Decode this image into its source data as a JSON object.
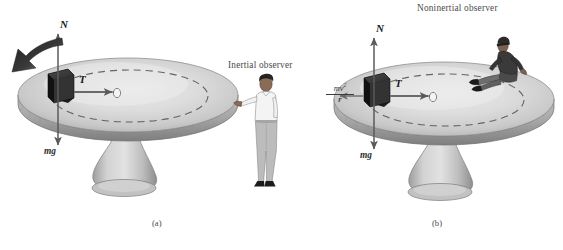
{
  "figure": {
    "background_color": "#ffffff",
    "panels": [
      {
        "id": "a",
        "caption": "(a)",
        "observer_label": "Inertial observer",
        "observer_type": "standing-man-beside-turntable",
        "forces": [
          {
            "symbol": "N",
            "name": "normal-force",
            "direction": "up"
          },
          {
            "symbol": "T",
            "name": "tension-force",
            "direction": "right-toward-center"
          },
          {
            "symbol": "mg",
            "name": "weight-force",
            "direction": "down"
          }
        ],
        "rotation_arrow": {
          "present": true,
          "direction": "counterclockwise-from-above"
        }
      },
      {
        "id": "b",
        "caption": "(b)",
        "observer_label": "Noninertial observer",
        "observer_type": "person-seated-on-turntable",
        "forces": [
          {
            "symbol": "N",
            "name": "normal-force",
            "direction": "up"
          },
          {
            "symbol": "T",
            "name": "tension-force",
            "direction": "right-toward-center"
          },
          {
            "symbol": "mg",
            "name": "weight-force",
            "direction": "down"
          },
          {
            "symbol": "mv2/r",
            "name": "fictitious-centrifugal-force",
            "direction": "left-outward",
            "numerator": "mv",
            "numerator_exponent": "2",
            "denominator": "r"
          }
        ],
        "rotation_arrow": {
          "present": false
        }
      }
    ],
    "colors": {
      "disk_top": "#d9d9d9",
      "disk_top_highlight": "#efefef",
      "disk_shadow": "#9a9a9a",
      "disk_rim": "#b0b0b0",
      "disk_rim_dark": "#808080",
      "pedestal": "#c4c4c4",
      "pedestal_dark": "#909090",
      "block": "#2e2e2e",
      "block_side": "#1a1a1a",
      "peg": "#f2f2f2",
      "arrow_stroke": "#5a5a5a",
      "rotation_arrow": "#2a2a2a",
      "dashed_path": "#4a4a4a",
      "text": "#3a3a3a",
      "skin": "#8a6b55",
      "shirt": "#f3f3f3",
      "pants": "#b9b9b9",
      "hair": "#262626",
      "shoes": "#1f1f1f",
      "rider_clothing": "#3d3d3d"
    },
    "labels": {
      "N": "N",
      "T": "T",
      "mg": "mg",
      "frac_num": "mv",
      "frac_exp": "2",
      "frac_den": "r"
    }
  }
}
